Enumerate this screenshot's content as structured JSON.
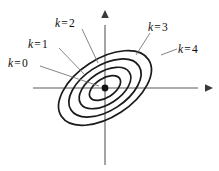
{
  "figure": {
    "background_color": "#ffffff",
    "contour_color": "#1a1a1a",
    "axis_color": "#5a5a5a",
    "leader_color": "#6e6e6e",
    "center_point": {
      "x": 105,
      "y": 88,
      "label": "origin"
    },
    "axes": {
      "x_axis": {
        "x1": 33,
        "y1": 88,
        "x2": 206,
        "y2": 88,
        "arrow": "right"
      },
      "y_axis": {
        "x1": 105,
        "y1": 165,
        "x2": 105,
        "y2": 17,
        "arrow": "up"
      }
    },
    "labels": [
      {
        "id": "k0",
        "var": "k",
        "eq": "=",
        "value": "0",
        "text": "k = 0"
      },
      {
        "id": "k1",
        "var": "k",
        "eq": "=",
        "value": "1",
        "text": "k = 1"
      },
      {
        "id": "k2",
        "var": "k",
        "eq": "=",
        "value": "2",
        "text": "k = 2"
      },
      {
        "id": "k3",
        "var": "k",
        "eq": "=",
        "value": "3",
        "text": "k = 3"
      },
      {
        "id": "k4",
        "var": "k",
        "eq": "=",
        "value": "4",
        "text": "k = 4"
      }
    ]
  },
  "chart_data": {
    "type": "line",
    "xlabel": "",
    "ylabel": "",
    "grid": false,
    "legend_position": "inline-leader-labels",
    "center": {
      "x": 0,
      "y": 0
    },
    "rotation_deg": -33,
    "contours": [
      {
        "k": 0,
        "label": "k = 0",
        "semi_major": 0,
        "semi_minor": 0,
        "kind": "point"
      },
      {
        "k": 1,
        "label": "k = 1",
        "semi_major": 17.5,
        "semi_minor": 9.5,
        "kind": "ellipse"
      },
      {
        "k": 2,
        "label": "k = 2",
        "semi_major": 29.0,
        "semi_minor": 16.0,
        "kind": "ellipse"
      },
      {
        "k": 3,
        "label": "k = 3",
        "semi_major": 40.5,
        "semi_minor": 22.5,
        "kind": "ellipse"
      },
      {
        "k": 4,
        "label": "k = 4",
        "semi_major": 52.0,
        "semi_minor": 29.0,
        "kind": "ellipse"
      }
    ],
    "annotations": [
      {
        "text": "k = 0",
        "points_to": "center-point"
      },
      {
        "text": "k = 1",
        "points_to": "ellipse-k1"
      },
      {
        "text": "k = 2",
        "points_to": "ellipse-k2"
      },
      {
        "text": "k = 3",
        "points_to": "ellipse-k3"
      },
      {
        "text": "k = 4",
        "points_to": "ellipse-k4"
      }
    ]
  }
}
